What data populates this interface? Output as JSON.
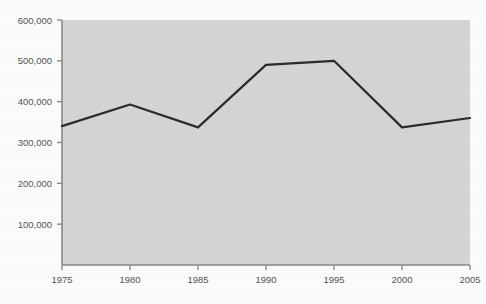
{
  "chart_data": {
    "type": "line",
    "title": "",
    "subtitle": "",
    "xlabel": "",
    "ylabel": "",
    "x": [
      1975,
      1980,
      1985,
      1990,
      1995,
      2000,
      2005
    ],
    "categories": [
      "1975",
      "1980",
      "1985",
      "1990",
      "1995",
      "2000",
      "2005"
    ],
    "values": [
      340000,
      393000,
      337000,
      490000,
      500000,
      337000,
      360000
    ],
    "series": [
      {
        "name": "series-1",
        "values": [
          340000,
          393000,
          337000,
          490000,
          500000,
          337000,
          360000
        ],
        "color": "#2b2b2b",
        "line_width": 2.2
      }
    ],
    "xlim": [
      1975,
      2005
    ],
    "ylim": [
      0,
      600000
    ],
    "x_ticks": [
      1975,
      1980,
      1985,
      1990,
      1995,
      2000,
      2005
    ],
    "x_tick_labels": [
      "1975",
      "1980",
      "1985",
      "1990",
      "1995",
      "2000",
      "2005"
    ],
    "y_ticks": [
      100000,
      200000,
      300000,
      400000,
      500000,
      600000
    ],
    "y_tick_labels": [
      "100,000",
      "200,000",
      "300,000",
      "400,000",
      "500,000",
      "600,000"
    ],
    "grid": false,
    "legend": false,
    "legend_position": "none",
    "plot_background_color": "#d4d4d4",
    "page_background_color": "#fbfbfb",
    "axis_color": "#8a8a8a",
    "tick_label_color": "#555555",
    "annotations": []
  }
}
